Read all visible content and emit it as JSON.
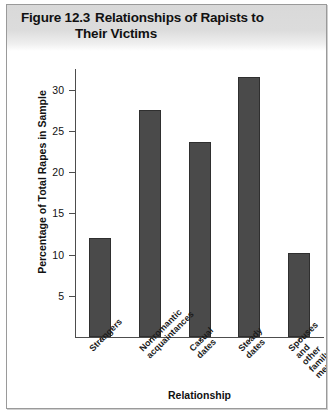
{
  "figure": {
    "number": "Figure 12.3",
    "title_line_1": "Relationships of Rapists to",
    "title_line_2": "Their Victims"
  },
  "chart_data": {
    "type": "bar",
    "xlabel": "Relationship",
    "ylabel": "Percentage of Total Rapes in Sample",
    "categories": [
      "Strangers",
      "Nonromantic\nacquaintances",
      "Casual\ndates",
      "Steady\ndates",
      "Spouses\nand other\nfamily\nmembers"
    ],
    "values": [
      12.0,
      27.5,
      23.7,
      31.5,
      10.2
    ],
    "ylim": [
      0,
      32.5
    ],
    "yticks": [
      5,
      10,
      15,
      20,
      25,
      30
    ],
    "ytick_labels": [
      "5",
      "10",
      "15",
      "20",
      "25",
      "30"
    ],
    "grid": false,
    "legend": false,
    "bar_color": "#4a4a4a",
    "bar_edge_color": "#2f2f2f",
    "axis_color": "#4d4d4d",
    "background_color": "#ffffff",
    "header_color": "#d9d9d9"
  }
}
